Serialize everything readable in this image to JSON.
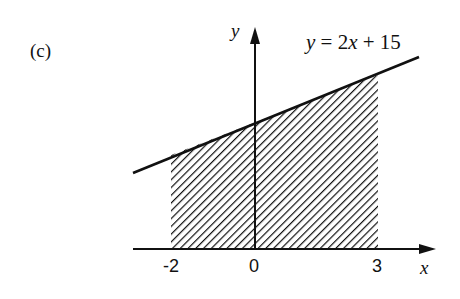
{
  "panel_label": "(c)",
  "axes": {
    "x_label": "x",
    "y_label": "y"
  },
  "equation": {
    "lhs": "y",
    "eq": " = ",
    "rhs_coef": "2",
    "rhs_var": "x",
    "rhs_rest": " + 15",
    "full": "y = 2x + 15"
  },
  "ticks": {
    "x": [
      "-2",
      "0",
      "3"
    ]
  },
  "shaded_region": {
    "from_x": -2,
    "to_x": 3,
    "under": "y = 2x + 15",
    "pattern": "diagonal-hatch"
  },
  "colors": {
    "ink": "#111111",
    "background": "#ffffff"
  }
}
